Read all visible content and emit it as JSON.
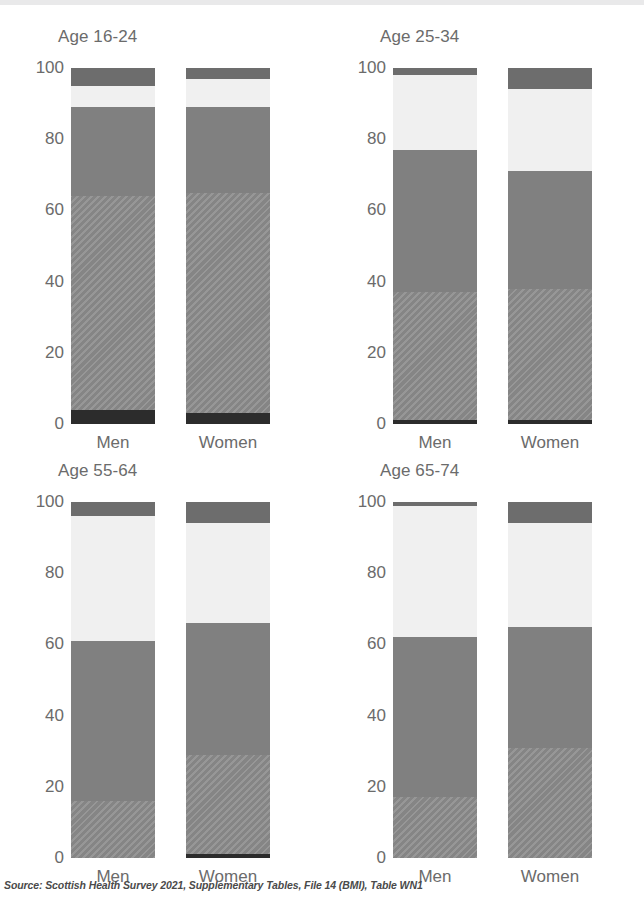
{
  "top_strip": {
    "color": "#e9e9ea"
  },
  "source_note": "Source: Scottish Health Survey 2021, Supplementary Tables, File 14 (BMI), Table WN1",
  "axis": {
    "ticks": [
      "100",
      "80",
      "60",
      "40",
      "20",
      "0"
    ],
    "tick_values": [
      100,
      80,
      60,
      40,
      20,
      0
    ],
    "ylim": [
      0,
      100
    ]
  },
  "group_labels": {
    "men": "Men",
    "women": "Women"
  },
  "palette": {
    "underweight": "#2c2c2c",
    "healthy_weight": "#8b8b8b",
    "overweight": "#808080",
    "obese": "#f0f0f0",
    "morbidly_obese": "#6d6d6d"
  },
  "panels": [
    {
      "title": "Age 16-24"
    },
    {
      "title": "Age 25-34"
    },
    {
      "title": "Age 55-64"
    },
    {
      "title": "Age 65-74"
    }
  ],
  "chart_data": {
    "type": "bar",
    "subtype": "stacked-percentage",
    "title": "",
    "xlabel": "",
    "ylabel": "",
    "ylim": [
      0,
      100
    ],
    "grid": false,
    "legend_position": "none",
    "source": "Source: Scottish Health Survey 2021, Supplementary Tables, File 14 (BMI), Table WN1",
    "categories": [
      "Men",
      "Women"
    ],
    "series": [
      {
        "name": "Underweight",
        "style": "black"
      },
      {
        "name": "Healthy weight",
        "style": "hatch"
      },
      {
        "name": "Overweight",
        "style": "mid"
      },
      {
        "name": "Obese",
        "style": "white"
      },
      {
        "name": "Morbidly obese",
        "style": "dark"
      }
    ],
    "panels": [
      {
        "title": "Age 16-24",
        "bars": [
          {
            "category": "Men",
            "segments": [
              {
                "series": "Underweight",
                "value": 4,
                "style": "black"
              },
              {
                "series": "Healthy weight",
                "value": 60,
                "style": "hatch"
              },
              {
                "series": "Overweight",
                "value": 25,
                "style": "mid"
              },
              {
                "series": "Obese",
                "value": 6,
                "style": "white"
              },
              {
                "series": "Morbidly obese",
                "value": 5,
                "style": "dark"
              }
            ]
          },
          {
            "category": "Women",
            "segments": [
              {
                "series": "Underweight",
                "value": 3,
                "style": "black"
              },
              {
                "series": "Healthy weight",
                "value": 62,
                "style": "hatch"
              },
              {
                "series": "Overweight",
                "value": 24,
                "style": "mid"
              },
              {
                "series": "Obese",
                "value": 8,
                "style": "white"
              },
              {
                "series": "Morbidly obese",
                "value": 3,
                "style": "dark"
              }
            ]
          }
        ]
      },
      {
        "title": "Age 25-34",
        "bars": [
          {
            "category": "Men",
            "segments": [
              {
                "series": "Underweight",
                "value": 1,
                "style": "black"
              },
              {
                "series": "Healthy weight",
                "value": 36,
                "style": "hatch"
              },
              {
                "series": "Overweight",
                "value": 40,
                "style": "mid"
              },
              {
                "series": "Obese",
                "value": 21,
                "style": "white"
              },
              {
                "series": "Morbidly obese",
                "value": 2,
                "style": "dark"
              }
            ]
          },
          {
            "category": "Women",
            "segments": [
              {
                "series": "Underweight",
                "value": 1,
                "style": "black"
              },
              {
                "series": "Healthy weight",
                "value": 37,
                "style": "hatch"
              },
              {
                "series": "Overweight",
                "value": 33,
                "style": "mid"
              },
              {
                "series": "Obese",
                "value": 23,
                "style": "white"
              },
              {
                "series": "Morbidly obese",
                "value": 6,
                "style": "dark"
              }
            ]
          }
        ]
      },
      {
        "title": "Age 55-64",
        "bars": [
          {
            "category": "Men",
            "segments": [
              {
                "series": "Underweight",
                "value": 0,
                "style": "black"
              },
              {
                "series": "Healthy weight",
                "value": 16,
                "style": "hatch"
              },
              {
                "series": "Overweight",
                "value": 45,
                "style": "mid"
              },
              {
                "series": "Obese",
                "value": 35,
                "style": "white"
              },
              {
                "series": "Morbidly obese",
                "value": 4,
                "style": "dark"
              }
            ]
          },
          {
            "category": "Women",
            "segments": [
              {
                "series": "Underweight",
                "value": 1,
                "style": "black"
              },
              {
                "series": "Healthy weight",
                "value": 28,
                "style": "hatch"
              },
              {
                "series": "Overweight",
                "value": 37,
                "style": "mid"
              },
              {
                "series": "Obese",
                "value": 28,
                "style": "white"
              },
              {
                "series": "Morbidly obese",
                "value": 6,
                "style": "dark"
              }
            ]
          }
        ]
      },
      {
        "title": "Age 65-74",
        "bars": [
          {
            "category": "Men",
            "segments": [
              {
                "series": "Underweight",
                "value": 0,
                "style": "black"
              },
              {
                "series": "Healthy weight",
                "value": 17,
                "style": "hatch"
              },
              {
                "series": "Overweight",
                "value": 45,
                "style": "mid"
              },
              {
                "series": "Obese",
                "value": 37,
                "style": "white"
              },
              {
                "series": "Morbidly obese",
                "value": 1,
                "style": "dark"
              }
            ]
          },
          {
            "category": "Women",
            "segments": [
              {
                "series": "Underweight",
                "value": 0,
                "style": "black"
              },
              {
                "series": "Healthy weight",
                "value": 31,
                "style": "hatch"
              },
              {
                "series": "Overweight",
                "value": 34,
                "style": "mid"
              },
              {
                "series": "Obese",
                "value": 29,
                "style": "white"
              },
              {
                "series": "Morbidly obese",
                "value": 6,
                "style": "dark"
              }
            ]
          }
        ]
      }
    ]
  }
}
